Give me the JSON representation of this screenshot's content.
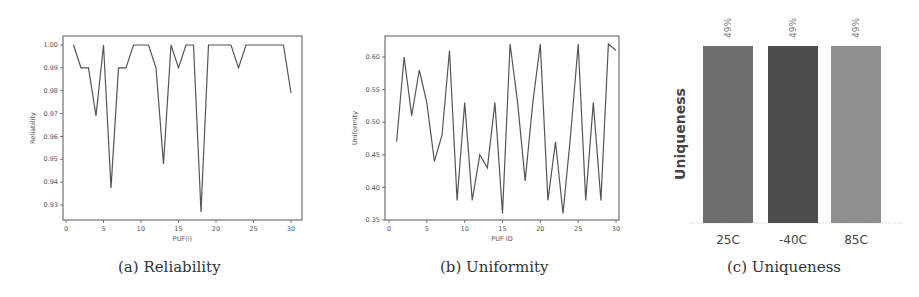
{
  "figure": {
    "panels": [
      {
        "id": "a",
        "caption": "(a) Reliability"
      },
      {
        "id": "b",
        "caption": "(b) Uniformity"
      },
      {
        "id": "c",
        "caption": "(c) Uniqueness"
      }
    ]
  },
  "chart_data": [
    {
      "type": "line",
      "title": "",
      "caption": "(a) Reliability",
      "xlabel": "PUF(i)",
      "ylabel": "Reliability",
      "x": [
        1,
        2,
        3,
        4,
        5,
        6,
        7,
        8,
        9,
        10,
        11,
        12,
        13,
        14,
        15,
        16,
        17,
        18,
        19,
        20,
        21,
        22,
        23,
        24,
        25,
        26,
        27,
        28,
        29,
        30
      ],
      "series": [
        {
          "name": "Reliability",
          "color": "#555555",
          "values": [
            1.0,
            0.99,
            0.99,
            0.969,
            1.0,
            0.9375,
            0.99,
            0.99,
            1.0,
            1.0,
            1.0,
            0.99,
            0.948,
            1.0,
            0.99,
            1.0,
            1.0,
            0.927,
            1.0,
            1.0,
            1.0,
            1.0,
            0.99,
            1.0,
            1.0,
            1.0,
            1.0,
            1.0,
            1.0,
            0.979
          ]
        }
      ],
      "xlim": [
        0,
        30.5
      ],
      "ylim": [
        0.925,
        1.002
      ],
      "xticks": [
        0,
        5,
        10,
        15,
        20,
        25,
        30
      ],
      "yticks": [
        0.93,
        0.94,
        0.95,
        0.96,
        0.97,
        0.98,
        0.99,
        1.0
      ],
      "ytick_labels": [
        "0.93",
        "0.94",
        "0.95",
        "0.96",
        "0.97",
        "0.98",
        "0.99",
        "1.00"
      ],
      "grid": false,
      "legend": null
    },
    {
      "type": "line",
      "title": "",
      "caption": "(b) Uniformity",
      "xlabel": "PUF ID",
      "ylabel": "Uniformity",
      "x": [
        1,
        2,
        3,
        4,
        5,
        6,
        7,
        8,
        9,
        10,
        11,
        12,
        13,
        14,
        15,
        16,
        17,
        18,
        19,
        20,
        21,
        22,
        23,
        24,
        25,
        26,
        27,
        28,
        29,
        30
      ],
      "series": [
        {
          "name": "Uniformity",
          "color": "#555555",
          "values": [
            0.47,
            0.6,
            0.51,
            0.58,
            0.53,
            0.44,
            0.48,
            0.61,
            0.38,
            0.53,
            0.38,
            0.45,
            0.43,
            0.53,
            0.36,
            0.62,
            0.53,
            0.41,
            0.53,
            0.62,
            0.38,
            0.47,
            0.36,
            0.48,
            0.62,
            0.38,
            0.53,
            0.38,
            0.62,
            0.61
          ]
        }
      ],
      "xlim": [
        0,
        30.5
      ],
      "ylim": [
        0.35,
        0.63
      ],
      "xticks": [
        0,
        5,
        10,
        15,
        20,
        25,
        30
      ],
      "yticks": [
        0.35,
        0.4,
        0.45,
        0.5,
        0.55,
        0.6
      ],
      "ytick_labels": [
        "0.35",
        "0.40",
        "0.45",
        "0.50",
        "0.55",
        "0.60"
      ],
      "grid": false,
      "legend": null
    },
    {
      "type": "bar",
      "title": "",
      "caption": "(c) Uniqueness",
      "xlabel": "",
      "ylabel": "Uniqueness",
      "categories": [
        "25C",
        "-40C",
        "85C"
      ],
      "values": [
        49,
        49,
        49
      ],
      "value_labels": [
        "49%",
        "49%",
        "49%"
      ],
      "colors": [
        "#6e6e6e",
        "#4d4d4d",
        "#8f8f8f"
      ],
      "ylim": [
        0,
        49
      ],
      "grid": false,
      "legend": null
    }
  ]
}
